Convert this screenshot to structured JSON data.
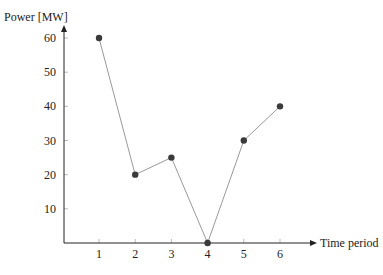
{
  "chart_data": {
    "type": "line",
    "title": "",
    "xlabel": "Time period",
    "ylabel": "Power [MW]",
    "x": [
      1,
      2,
      3,
      4,
      5,
      6
    ],
    "series": [
      {
        "name": "Power",
        "values": [
          60,
          20,
          25,
          0,
          30,
          40
        ]
      }
    ],
    "xticks": [
      "1",
      "2",
      "3",
      "4",
      "5",
      "6"
    ],
    "yticks": [
      "10",
      "20",
      "30",
      "40",
      "50",
      "60"
    ],
    "xlim": [
      0,
      6.9
    ],
    "ylim": [
      0,
      62
    ],
    "grid": false,
    "legend": null,
    "colors": {
      "axis": "#222222",
      "line": "#999999",
      "marker": "#3a3a3a"
    }
  }
}
